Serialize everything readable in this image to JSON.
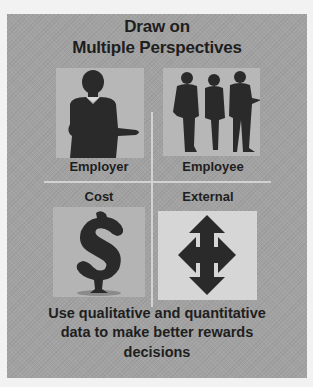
{
  "title": {
    "line1": "Draw on",
    "line2": "Multiple Perspectives"
  },
  "quadrants": [
    {
      "label": "Employer",
      "icon": "businesswoman-silhouette-icon"
    },
    {
      "label": "Employee",
      "icon": "business-people-group-silhouette-icon"
    },
    {
      "label": "Cost",
      "icon": "dollar-sign-icon"
    },
    {
      "label": "External",
      "icon": "four-way-arrow-icon"
    }
  ],
  "footer": {
    "line1": "Use qualitative and quantitative",
    "line2": "data to make better rewards",
    "line3": "decisions"
  },
  "colors": {
    "page_background": "#f2f2f2",
    "panel_background": "#a2a2a2",
    "tile_background": "#b7b7b7",
    "external_tile_background": "#d6d6d6",
    "text": "#1e1e1e",
    "divider": "#d2d2d2"
  }
}
